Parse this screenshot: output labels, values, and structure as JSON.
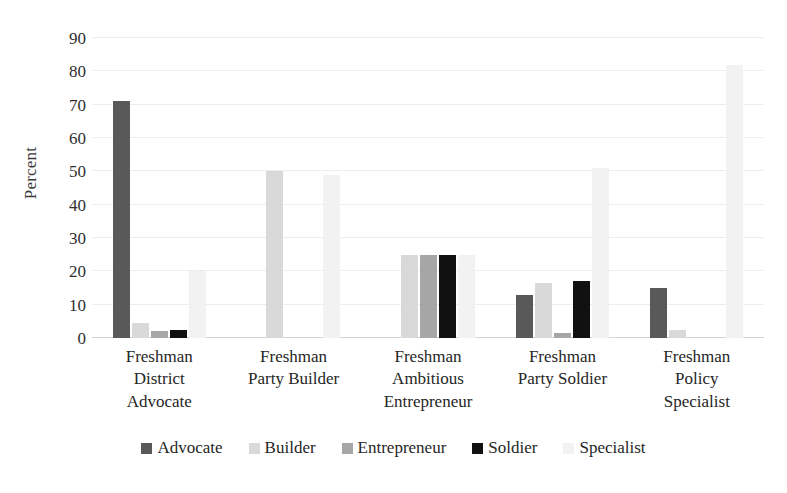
{
  "chart_data": {
    "type": "bar",
    "title": "",
    "subtitle": "",
    "xlabel": "",
    "ylabel": "Percent",
    "ylim": [
      0,
      90
    ],
    "ytick_step": 10,
    "yticks": [
      0,
      10,
      20,
      30,
      40,
      50,
      60,
      70,
      80,
      90
    ],
    "grid": true,
    "legend_position": "bottom",
    "categories": [
      "Freshman District Advocate",
      "Freshman Party Builder",
      "Freshman Ambitious Entrepreneur",
      "Freshman Party Soldier",
      "Freshman Policy Specialist"
    ],
    "category_lines": [
      [
        "Freshman",
        "District",
        "Advocate"
      ],
      [
        "Freshman",
        "Party Builder"
      ],
      [
        "Freshman",
        "Ambitious",
        "Entrepreneur"
      ],
      [
        "Freshman",
        "Party Soldier"
      ],
      [
        "Freshman",
        "Policy",
        "Specialist"
      ]
    ],
    "series": [
      {
        "name": "Advocate",
        "color": "#595959",
        "values": [
          71,
          0,
          0,
          13,
          15
        ]
      },
      {
        "name": "Builder",
        "color": "#d9d9d9",
        "values": [
          4.5,
          50,
          25,
          16.5,
          2.5
        ]
      },
      {
        "name": "Entrepreneur",
        "color": "#a6a6a6",
        "values": [
          2,
          0,
          25,
          1.5,
          0
        ]
      },
      {
        "name": "Soldier",
        "color": "#111111",
        "values": [
          2.5,
          0,
          25,
          17,
          0
        ]
      },
      {
        "name": "Specialist",
        "color": "#f2f2f2",
        "values": [
          20,
          49,
          25,
          51,
          82
        ]
      }
    ]
  },
  "legend": {
    "items": [
      {
        "label": "Advocate"
      },
      {
        "label": "Builder"
      },
      {
        "label": "Entrepreneur"
      },
      {
        "label": "Soldier"
      },
      {
        "label": "Specialist"
      }
    ]
  }
}
